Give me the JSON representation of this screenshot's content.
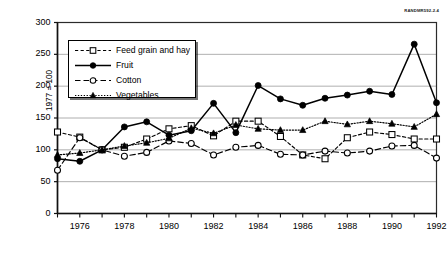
{
  "figure_id": "RANDMR592-2.4",
  "axis": {
    "y_label": "1977 = 100",
    "y_ticks": [
      "0",
      "50",
      "100",
      "150",
      "200",
      "250",
      "300"
    ],
    "x_ticks": [
      "1976",
      "1978",
      "1980",
      "1982",
      "1984",
      "1986",
      "1988",
      "1990",
      "1992"
    ]
  },
  "legend": {
    "items": [
      {
        "label": "Feed grain and hay",
        "key": "dashed-open-square"
      },
      {
        "label": "Fruit",
        "key": "solid-filled-circle"
      },
      {
        "label": "Cotton",
        "key": "longdash-open-circle"
      },
      {
        "label": "Vegetables",
        "key": "dotted-filled-triangle"
      }
    ]
  },
  "chart_data": {
    "type": "line",
    "title": "",
    "xlabel": "",
    "ylabel": "1977 = 100",
    "xlim": [
      1975,
      1992
    ],
    "ylim": [
      0,
      300
    ],
    "ytick_values": [
      0,
      50,
      100,
      150,
      200,
      250,
      300
    ],
    "xtick_values": [
      1976,
      1978,
      1980,
      1982,
      1984,
      1986,
      1988,
      1990,
      1992
    ],
    "grid": "horizontal",
    "legend_position": "upper-left-inside",
    "x": [
      1975,
      1976,
      1977,
      1978,
      1979,
      1980,
      1981,
      1982,
      1983,
      1984,
      1985,
      1986,
      1987,
      1988,
      1989,
      1990,
      1991,
      1992
    ],
    "series": [
      {
        "name": "Feed grain and hay",
        "marker": "open-square",
        "line": "dashed",
        "values": [
          128,
          120,
          100,
          104,
          117,
          133,
          138,
          122,
          145,
          145,
          121,
          92,
          86,
          119,
          128,
          124,
          117,
          117
        ]
      },
      {
        "name": "Fruit",
        "marker": "filled-circle",
        "line": "solid",
        "values": [
          86,
          82,
          100,
          136,
          144,
          123,
          130,
          173,
          127,
          201,
          180,
          170,
          181,
          186,
          192,
          187,
          266,
          174
        ]
      },
      {
        "name": "Cotton",
        "marker": "open-circle",
        "line": "long-dashed",
        "values": [
          68,
          119,
          100,
          90,
          96,
          114,
          110,
          92,
          104,
          107,
          93,
          92,
          98,
          95,
          98,
          106,
          107,
          87
        ]
      },
      {
        "name": "Vegetables",
        "marker": "filled-triangle",
        "line": "dotted",
        "values": [
          92,
          95,
          100,
          106,
          111,
          118,
          134,
          126,
          139,
          133,
          131,
          131,
          145,
          140,
          145,
          141,
          136,
          156
        ]
      }
    ]
  }
}
